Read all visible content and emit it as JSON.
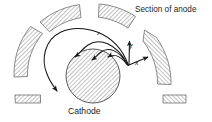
{
  "figure": {
    "type": "magnetron-electron-trajectory-diagram",
    "background_color": "#ffffff",
    "line_color": "#1a1a1a",
    "hatch_color": "#8a8a8a",
    "labels": {
      "anode": "Section of anode",
      "cathode": "Cathode",
      "axis_y": "y",
      "axis_x": "x",
      "arc": "z"
    },
    "cathode": {
      "shape": "circle",
      "cx": 93,
      "cy": 76,
      "r": 27,
      "hatched": true
    },
    "anode_segments": [
      {
        "id": "anode-left-upper",
        "hatched": true
      },
      {
        "id": "anode-top-left",
        "hatched": true
      },
      {
        "id": "anode-top-right",
        "hatched": true
      },
      {
        "id": "anode-right",
        "hatched": true
      },
      {
        "id": "anode-stub-bottom-left",
        "hatched": true
      },
      {
        "id": "anode-stub-bottom-right",
        "hatched": true
      }
    ],
    "trajectories": [
      {
        "id": "trajectory-outer-arc",
        "arrowhead": true
      },
      {
        "id": "trajectory-mid-arc",
        "arrowhead": true
      },
      {
        "id": "trajectory-inner-arc",
        "arrowhead": true
      },
      {
        "id": "trajectory-short-arc",
        "arrowhead": true
      }
    ],
    "axes": {
      "origin_x": 129,
      "origin_y": 65,
      "y_arrow": true,
      "x_arrow": true
    }
  }
}
